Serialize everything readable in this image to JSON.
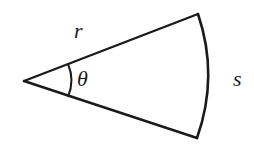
{
  "diagram": {
    "type": "circular-sector",
    "labels": {
      "radius": "r",
      "angle": "θ",
      "arc_length": "s"
    },
    "geometry": {
      "apex": [
        24,
        81
      ],
      "top_end": [
        198,
        14
      ],
      "bottom_end": [
        197,
        138
      ],
      "arc_peak": [
        209,
        81
      ]
    },
    "colors": {
      "stroke": "#1a1a1a",
      "background": "#ffffff"
    }
  }
}
